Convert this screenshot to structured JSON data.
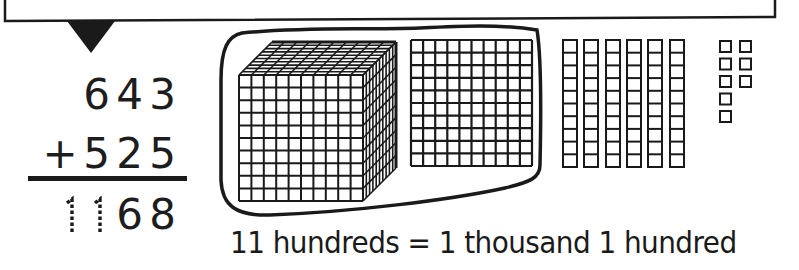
{
  "problem": {
    "addend_1": [
      "6",
      "4",
      "3"
    ],
    "operator": "+",
    "addend_2": [
      "5",
      "2",
      "5"
    ],
    "sum": [
      "1",
      "1",
      "6",
      "8"
    ],
    "sum_traced_digits": [
      "1",
      "1"
    ],
    "sum_filled_digits": [
      "6",
      "8"
    ]
  },
  "blocks": {
    "thousands_cube": {
      "count": 1,
      "grid": "10x10x10"
    },
    "hundreds_flats": {
      "count": 1,
      "grid": "10x10"
    },
    "tens_rods": {
      "count": 6,
      "units_per_rod": 10
    },
    "ones_units": {
      "count": 8,
      "columns": [
        5,
        3
      ]
    },
    "circled_group": "1 thousand cube + 1 hundred flat"
  },
  "caption": "11 hundreds = 1 thousand 1 hundred",
  "colors": {
    "ink": "#1a1a1a",
    "background": "#ffffff"
  }
}
